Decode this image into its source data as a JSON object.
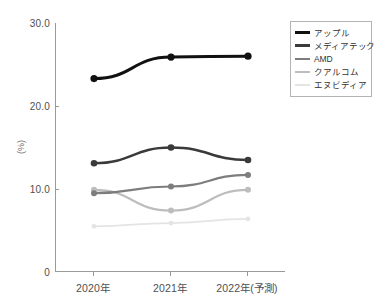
{
  "chart_data": {
    "type": "line",
    "title": "",
    "subtitle": "",
    "xlabel": "",
    "ylabel": "(%)",
    "categories": [
      "2020年",
      "2021年",
      "2022年(予測)"
    ],
    "ylim": [
      0,
      30
    ],
    "yticks": [
      "0",
      "10.0",
      "20.0",
      "30.0"
    ],
    "ytick_values": [
      0,
      10,
      20,
      30
    ],
    "grid": false,
    "legend_position": "right-top",
    "markers": true,
    "series": [
      {
        "name": "アップル",
        "values": [
          23.3,
          25.9,
          26.0
        ],
        "color": "#111111"
      },
      {
        "name": "メディアテック",
        "values": [
          13.1,
          15.0,
          13.5
        ],
        "color": "#3a3a3a"
      },
      {
        "name": "AMD",
        "values": [
          9.5,
          10.3,
          11.7
        ],
        "color": "#7d7d7d"
      },
      {
        "name": "クアルコム",
        "values": [
          9.9,
          7.4,
          9.9
        ],
        "color": "#bdbdbd"
      },
      {
        "name": "エヌビディア",
        "values": [
          5.5,
          5.9,
          6.4
        ],
        "color": "#e4e4e4"
      }
    ]
  },
  "legend": {
    "items": [
      {
        "label": "アップル"
      },
      {
        "label": "メディアテック"
      },
      {
        "label": "AMD"
      },
      {
        "label": "クアルコム"
      },
      {
        "label": "エヌビディア"
      }
    ]
  },
  "axes": {
    "y": {
      "label": "(%)",
      "ticks": [
        {
          "text": "30.0"
        },
        {
          "text": "20.0"
        },
        {
          "text": "10.0"
        },
        {
          "text": "0"
        }
      ]
    },
    "x": {
      "ticks": [
        {
          "text": "2020年"
        },
        {
          "text": "2021年"
        },
        {
          "text": "2022年(予測)"
        }
      ]
    }
  }
}
